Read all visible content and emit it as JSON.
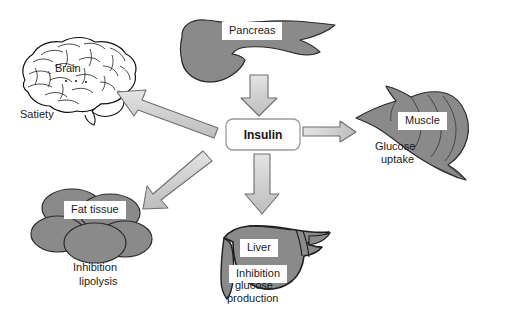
{
  "diagram": {
    "center_node": {
      "label": "Insulin",
      "name": "insulin-node"
    },
    "colors": {
      "organ_fill": "#8a8a8a",
      "organ_stroke": "#2b2b2b",
      "arrow_fill": "#d2d2d2",
      "arrow_stroke": "#6e6e6e",
      "box_stroke": "#9a9a9a",
      "background": "#ffffff",
      "text": "#1a1a1a"
    },
    "nodes": [
      {
        "id": "pancreas",
        "label": "Pancreas",
        "sublabel": "",
        "icon": "pancreas-icon"
      },
      {
        "id": "brain",
        "label": "Brain",
        "sublabel": "Satiety",
        "icon": "brain-icon"
      },
      {
        "id": "muscle",
        "label": "Muscle",
        "sublabel": "Glucose\nuptake",
        "icon": "muscle-icon"
      },
      {
        "id": "fat",
        "label": "Fat tissue",
        "sublabel": "Inhibition\nlipolysis",
        "icon": "fat-tissue-icon"
      },
      {
        "id": "liver",
        "label": "Liver",
        "sublabel": "Inhibition\nglucose\nproduction",
        "icon": "liver-icon"
      }
    ],
    "labels": {
      "pancreas": "Pancreas",
      "brain": "Brain",
      "satiety": "Satiety",
      "muscle": "Muscle",
      "glucose_uptake_l1": "Glucose",
      "glucose_uptake_l2": "uptake",
      "fat_tissue": "Fat tissue",
      "inhibition_lipolysis_l1": "Inhibition",
      "inhibition_lipolysis_l2": "lipolysis",
      "liver": "Liver",
      "inhibition_glucose_l1": "Inhibition",
      "inhibition_glucose_l2": "glucose",
      "inhibition_glucose_l3": "production",
      "insulin": "Insulin"
    },
    "arrows": [
      {
        "id": "pancreas-to-insulin",
        "from": "pancreas",
        "to": "insulin",
        "direction": "down",
        "style": "block"
      },
      {
        "id": "insulin-to-brain",
        "from": "insulin",
        "to": "brain",
        "direction": "up-left",
        "style": "block"
      },
      {
        "id": "insulin-to-fat",
        "from": "insulin",
        "to": "fat",
        "direction": "down-left",
        "style": "block"
      },
      {
        "id": "insulin-to-liver",
        "from": "insulin",
        "to": "liver",
        "direction": "down",
        "style": "block"
      },
      {
        "id": "insulin-to-muscle",
        "from": "insulin",
        "to": "muscle",
        "direction": "right",
        "style": "thin"
      }
    ]
  }
}
